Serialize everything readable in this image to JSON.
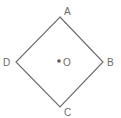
{
  "diagram": {
    "type": "square-rotated-45",
    "stroke_color": "#6e6e6e",
    "dot_color": "#5a5a5a",
    "vertices": [
      {
        "label": "A",
        "x": 60,
        "y": 17
      },
      {
        "label": "B",
        "x": 103,
        "y": 62
      },
      {
        "label": "C",
        "x": 60,
        "y": 107
      },
      {
        "label": "D",
        "x": 16,
        "y": 62
      }
    ],
    "center": {
      "label": "O",
      "x": 59,
      "y": 61
    }
  }
}
